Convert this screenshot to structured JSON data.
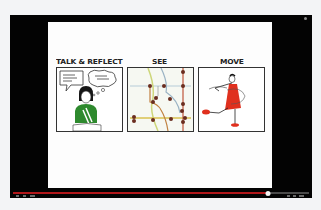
{
  "player": {
    "title": "",
    "progress_percent": 86,
    "colors": {
      "background": "#030303",
      "progress": "#b1171a",
      "track": "#4a4a4a"
    }
  },
  "slide": {
    "panels": [
      {
        "heading": "TALK & REFLECT",
        "illustration": "person-thinking-with-speech-bubbles"
      },
      {
        "heading": "SEE",
        "illustration": "subway-map-lines-with-stops"
      },
      {
        "heading": "MOVE",
        "illustration": "dancer-in-red-dress-spinning"
      }
    ]
  },
  "controls": {
    "left": [
      "play-icon",
      "next-icon",
      "volume-icon"
    ],
    "right": [
      "settings-icon",
      "captions-icon",
      "fullscreen-icon"
    ]
  }
}
